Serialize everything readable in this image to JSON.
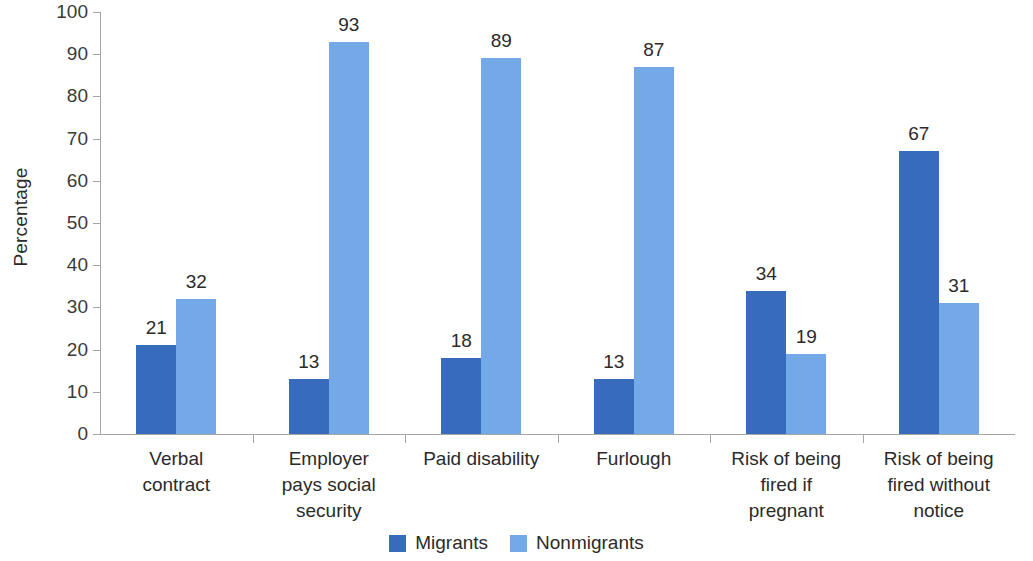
{
  "chart_data": {
    "type": "bar",
    "title": "",
    "xlabel": "",
    "ylabel": "Percentage",
    "ylim": [
      0,
      100
    ],
    "ytick_step": 10,
    "yticks": [
      0,
      10,
      20,
      30,
      40,
      50,
      60,
      70,
      80,
      90,
      100
    ],
    "grid": false,
    "legend_position": "bottom-center",
    "categories": [
      "Verbal contract",
      "Employer pays social security",
      "Paid disability",
      "Furlough",
      "Risk of being fired if pregnant",
      "Risk of being fired without notice"
    ],
    "category_label_lines": [
      [
        "Verbal",
        "contract"
      ],
      [
        "Employer",
        "pays social",
        "security"
      ],
      [
        "Paid disability"
      ],
      [
        "Furlough"
      ],
      [
        "Risk of being",
        "fired if",
        "pregnant"
      ],
      [
        "Risk of being",
        "fired without",
        "notice"
      ]
    ],
    "series": [
      {
        "name": "Migrants",
        "color": "#376cbc",
        "values": [
          21,
          13,
          18,
          13,
          34,
          67
        ]
      },
      {
        "name": "Nonmigrants",
        "color": "#74a9e8",
        "values": [
          32,
          93,
          89,
          87,
          19,
          31
        ]
      }
    ]
  },
  "axis": {
    "tick_color": "#a6a6a6"
  }
}
